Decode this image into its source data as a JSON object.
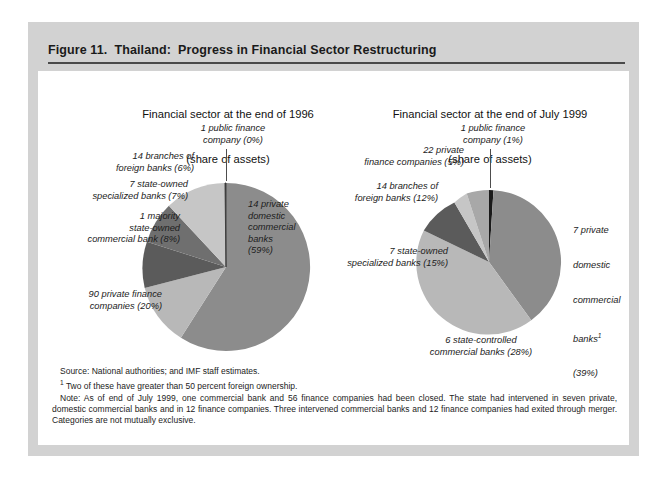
{
  "figure": {
    "title": "Figure 11.  Thailand:  Progress in Financial Sector Restructuring"
  },
  "colors": {
    "slice_mid_gray": "#8c8c8c",
    "slice_light_gray": "#c6c6c6",
    "slice_dark_gray": "#5b5b5b",
    "slice_pale_gray": "#b0b0b0",
    "slice_black": "#1a1a1a",
    "panel_gray": "#d2d2d2",
    "rule_dark": "#4a4a4a",
    "page_white": "#ffffff"
  },
  "charts": [
    {
      "id": "chart-1996",
      "title_line1": "Financial sector at the end of 1996",
      "title_line2": "(share of assets)",
      "labels": {
        "public_finance": "1 public finance\ncompany (0%)",
        "foreign_branches": "14 branches of\nforeign banks (6%)",
        "state_specialized": "7 state-owned\nspecialized banks (7%)",
        "majority_state": "1 majority\nstate-owned\ncommercial bank (8%)",
        "private_finance": "90 private finance\ncompanies (20%)",
        "private_domestic": "14 private\ndomestic\ncommercial\nbanks\n(59%)"
      }
    },
    {
      "id": "chart-1999",
      "title_line1": "Financial sector at the end of July 1999",
      "title_line2": "(share of assets)",
      "labels": {
        "public_finance": "1 public finance\ncompany (1%)",
        "private_finance": "22 private\nfinance companies (5%)",
        "foreign_branches": "14 branches of\nforeign banks (12%)",
        "state_specialized": "7 state-owned\nspecialized banks (15%)",
        "state_controlled": "6 state-controlled\ncommercial banks (28%)",
        "private_domestic_l1": "7 private",
        "private_domestic_l2": "domestic",
        "private_domestic_l3": "commercial",
        "private_domestic_l4": "banks",
        "private_domestic_sup": "1",
        "private_domestic_l5": "(39%)"
      }
    }
  ],
  "chart_data": [
    {
      "type": "pie",
      "title": "Financial sector at the end of 1996 (share of assets)",
      "unit": "percent share of assets",
      "start_angle_deg": 0,
      "direction": "clockwise",
      "categories": [
        "14 private domestic commercial banks",
        "90 private finance companies",
        "1 majority state-owned commercial bank",
        "7 state-owned specialized banks",
        "14 branches of foreign banks",
        "1 public finance company"
      ],
      "values": [
        59,
        20,
        8,
        7,
        6,
        0
      ],
      "counts": [
        14,
        90,
        1,
        7,
        14,
        1
      ],
      "colors": [
        "#8c8c8c",
        "#b8b8b8",
        "#5b5b5b",
        "#6f6f6f",
        "#c6c6c6",
        "#3a3a3a"
      ]
    },
    {
      "type": "pie",
      "title": "Financial sector at the end of July 1999 (share of assets)",
      "unit": "percent share of assets",
      "start_angle_deg": 0,
      "direction": "clockwise",
      "categories": [
        "7 private domestic commercial banks",
        "6 state-controlled commercial banks",
        "7 state-owned specialized banks",
        "14 branches of foreign banks",
        "22 private finance companies",
        "1 public finance company"
      ],
      "values": [
        39,
        28,
        15,
        12,
        5,
        1
      ],
      "counts": [
        7,
        6,
        7,
        14,
        22,
        1
      ],
      "colors": [
        "#8c8c8c",
        "#b8b8b8",
        "#5b5b5b",
        "#c6c6c6",
        "#a8a8a8",
        "#1a1a1a"
      ]
    }
  ],
  "notes": {
    "source": "Source:  National authorities; and IMF staff estimates.",
    "footnote_marker": "1",
    "footnote": " Two of these have greater than 50 percent foreign ownership.",
    "note": "Note:  As of end of July 1999, one commercial bank and 56 finance companies had been closed. The state had intervened in seven private, domestic commercial banks and in 12 finance companies. Three intervened commercial banks and 12 finance companies had exited through merger. Categories are not mutually exclusive."
  }
}
